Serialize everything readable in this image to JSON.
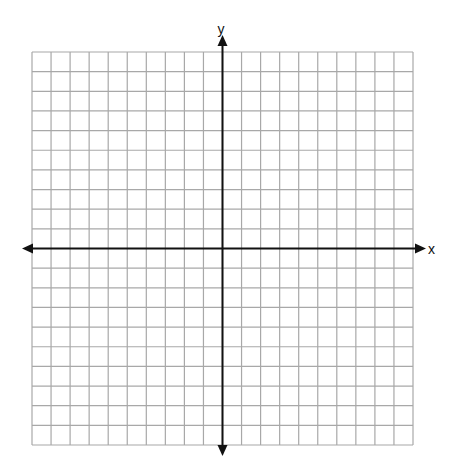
{
  "diagram": {
    "type": "coordinate-plane",
    "grid": {
      "columns": 20,
      "rows": 20,
      "left": 32,
      "top": 52,
      "right": 413,
      "bottom": 445,
      "line_color": "#a8a8a8"
    },
    "axes": {
      "color": "#111111",
      "x_label": "x",
      "y_label": "y",
      "origin_px": [
        221,
        250
      ]
    }
  }
}
